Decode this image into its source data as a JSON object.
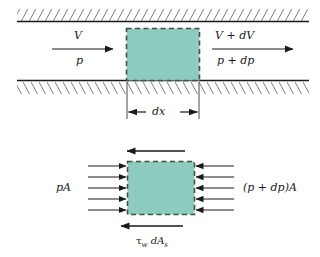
{
  "figure": {
    "colors": {
      "fluid_element_fill": "#8bccbf",
      "fluid_element_edge": "#4a4a4a",
      "wall_line": "#1a1a1a",
      "hatch_line": "#1a1a1a",
      "arrow": "#1a1a1a",
      "text": "#1a1a1a",
      "background": "#ffffff"
    },
    "top_panel": {
      "name": "duct-flow-panel",
      "inlet_velocity_label": "V",
      "inlet_pressure_label": "p",
      "outlet_velocity_label": "V + dV",
      "outlet_pressure_label": "p + dp",
      "length_dimension_label": "dx",
      "upper_wall_name": "upper-duct-wall",
      "lower_wall_name": "lower-duct-wall"
    },
    "bottom_panel": {
      "name": "force-balance-panel",
      "left_force_label": "pA",
      "right_force_label": "(p + dp)A",
      "shear_force_label_main": "τ",
      "shear_force_label_sub1": "w",
      "shear_force_label_mid": " dA",
      "shear_force_label_sub2": "s",
      "shear_force_label_full": "τw dAs",
      "left_arrow_count": 5,
      "right_arrow_count": 5,
      "top_shear_arrow_direction": "left",
      "bottom_shear_arrow_direction": "left"
    }
  }
}
